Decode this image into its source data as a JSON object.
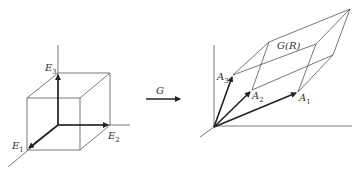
{
  "diagram": {
    "left": {
      "name": "unit-cube",
      "labels": {
        "e1": "E",
        "e1_sub": "1",
        "e2": "E",
        "e2_sub": "2",
        "e3": "E",
        "e3_sub": "3"
      }
    },
    "map": {
      "label": "G"
    },
    "right": {
      "name": "parallelepiped",
      "region_label": "G(R)",
      "labels": {
        "a1": "A",
        "a1_sub": "1",
        "a2": "A",
        "a2_sub": "2",
        "a3": "A",
        "a3_sub": "3"
      }
    },
    "colors": {
      "line": "#555555",
      "vector": "#222222",
      "background": "#ffffff"
    }
  }
}
